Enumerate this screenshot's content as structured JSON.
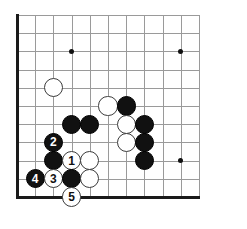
{
  "diagram": {
    "type": "go-board-diagram",
    "board": {
      "visible_columns": 11,
      "visible_rows": 11,
      "origin_x": 17,
      "origin_y": 15,
      "spacing": 18.2,
      "stone_radius": 9.6,
      "line_color": "#9a9a9a",
      "edge_color": "#1a1a1a",
      "background": "#ffffff",
      "black_color": "#111111",
      "white_color": "#ffffff"
    },
    "star_points": [
      {
        "name": "star-point-upper-left",
        "col": 3,
        "row": 2
      },
      {
        "name": "star-point-upper-right",
        "col": 9,
        "row": 2
      },
      {
        "name": "star-point-lower-right",
        "col": 9,
        "row": 8
      }
    ],
    "stones": [
      {
        "name": "white-stone-a",
        "color": "white",
        "col": 2,
        "row": 4,
        "label": ""
      },
      {
        "name": "white-stone-b",
        "color": "white",
        "col": 5,
        "row": 5,
        "label": ""
      },
      {
        "name": "black-stone-a",
        "color": "black",
        "col": 6,
        "row": 5,
        "label": ""
      },
      {
        "name": "black-stone-b",
        "color": "black",
        "col": 3,
        "row": 6,
        "label": ""
      },
      {
        "name": "black-stone-c",
        "color": "black",
        "col": 4,
        "row": 6,
        "label": ""
      },
      {
        "name": "white-stone-c",
        "color": "white",
        "col": 6,
        "row": 6,
        "label": ""
      },
      {
        "name": "black-stone-d",
        "color": "black",
        "col": 7,
        "row": 6,
        "label": ""
      },
      {
        "name": "black-stone-move-2",
        "color": "black",
        "col": 2,
        "row": 7,
        "label": "2"
      },
      {
        "name": "white-stone-d",
        "color": "white",
        "col": 6,
        "row": 7,
        "label": ""
      },
      {
        "name": "black-stone-e",
        "color": "black",
        "col": 7,
        "row": 7,
        "label": ""
      },
      {
        "name": "black-stone-f",
        "color": "black",
        "col": 2,
        "row": 8,
        "label": ""
      },
      {
        "name": "white-stone-move-1",
        "color": "white",
        "col": 3,
        "row": 8,
        "label": "1"
      },
      {
        "name": "white-stone-e",
        "color": "white",
        "col": 4,
        "row": 8,
        "label": ""
      },
      {
        "name": "black-stone-g",
        "color": "black",
        "col": 7,
        "row": 8,
        "label": ""
      },
      {
        "name": "black-stone-move-4",
        "color": "black",
        "col": 1,
        "row": 9,
        "label": "4"
      },
      {
        "name": "white-stone-move-3",
        "color": "white",
        "col": 2,
        "row": 9,
        "label": "3"
      },
      {
        "name": "black-stone-h",
        "color": "black",
        "col": 3,
        "row": 9,
        "label": ""
      },
      {
        "name": "white-stone-f",
        "color": "white",
        "col": 4,
        "row": 9,
        "label": ""
      },
      {
        "name": "white-stone-move-5",
        "color": "white",
        "col": 3,
        "row": 10,
        "label": "5"
      }
    ]
  }
}
